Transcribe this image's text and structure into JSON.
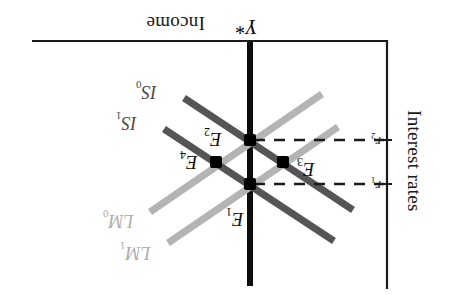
{
  "figure": {
    "kind": "is-lm-diagram",
    "orientation": "rotated-180",
    "axes": {
      "income_label": "Income",
      "interest_label": "Interest rates",
      "potential_output_label": "Y*"
    },
    "ticks": [
      {
        "id": "r2",
        "label": "r",
        "sub": "2",
        "y": 140
      },
      {
        "id": "r1",
        "label": "r",
        "sub": "1",
        "y": 184
      }
    ],
    "curves": [
      {
        "id": "IS0",
        "label": "IS",
        "sub": "0",
        "color": "#555555",
        "kind": "is"
      },
      {
        "id": "IS1",
        "label": "IS",
        "sub": "1",
        "color": "#555555",
        "kind": "is"
      },
      {
        "id": "LM0",
        "label": "LM",
        "sub": "0",
        "color": "#b4b4b4",
        "kind": "lm"
      },
      {
        "id": "LM1",
        "label": "LM",
        "sub": "1",
        "color": "#b4b4b4",
        "kind": "lm"
      }
    ],
    "points": [
      {
        "id": "E1",
        "label": "E",
        "sub": "1",
        "x": 250,
        "y": 184
      },
      {
        "id": "E2",
        "label": "E",
        "sub": "2",
        "x": 250,
        "y": 140
      },
      {
        "id": "E3",
        "label": "E",
        "sub": "3",
        "x": 283,
        "y": 162
      },
      {
        "id": "E4",
        "label": "E",
        "sub": "4",
        "x": 216,
        "y": 162
      }
    ],
    "colors": {
      "axis": "#1a1a1a",
      "is_curve": "#555555",
      "lm_curve": "#b4b4b4",
      "marker": "#000000",
      "dashed": "#1a1a1a",
      "background": "#ffffff"
    }
  }
}
